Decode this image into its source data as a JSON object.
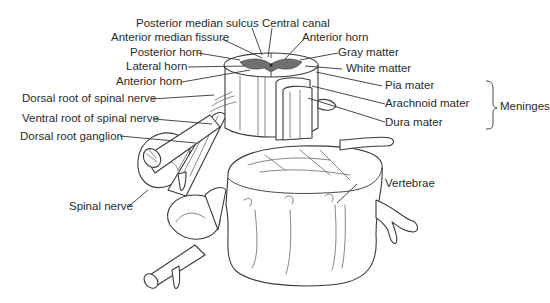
{
  "figure": {
    "labels": {
      "posterior_median_sulcus": "Posterior median sulcus",
      "central_canal": "Central canal",
      "anterior_median_fissure": "Anterior median fissure",
      "anterior_horn_right": "Anterior horn",
      "posterior_horn": "Posterior horn",
      "gray_matter": "Gray matter",
      "lateral_horn": "Lateral horn",
      "white_matter": "White matter",
      "anterior_horn_left": "Anterior horn",
      "pia_mater": "Pia mater",
      "dorsal_root": "Dorsal root of spinal nerve",
      "arachnoid_mater": "Arachnoid mater",
      "ventral_root": "Ventral root of spinal nerve",
      "dura_mater": "Dura mater",
      "dorsal_root_ganglion": "Dorsal root ganglion",
      "meninges": "Meninges",
      "vertebrae": "Vertebrae",
      "spinal_nerve": "Spinal nerve"
    },
    "bracket_group": {
      "name": "Meninges",
      "members": [
        "Pia mater",
        "Arachnoid mater",
        "Dura mater"
      ]
    }
  }
}
